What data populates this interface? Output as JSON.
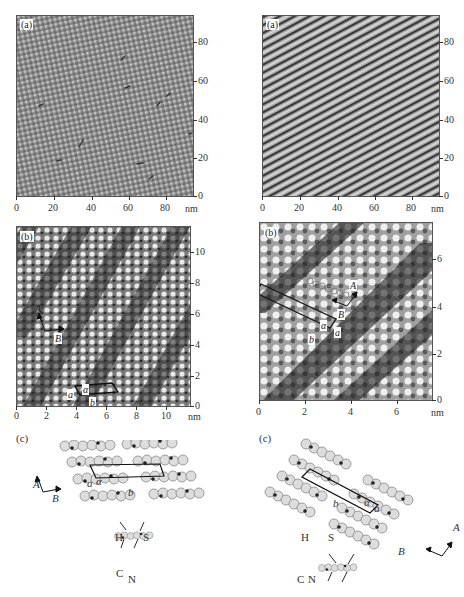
{
  "figure": {
    "panels": [
      {
        "id": "left-a",
        "label": "(a)",
        "x_ticks": [
          "0",
          "20",
          "40",
          "60",
          "80"
        ],
        "y_ticks": [
          "80",
          "60",
          "40",
          "20",
          "0"
        ],
        "unit": "nm",
        "range_nm": 95,
        "texture": "square lattice",
        "colors": {
          "base": "#8c8c8c",
          "light": "#c8c8c8",
          "dark": "#4a4a4a"
        }
      },
      {
        "id": "right-a",
        "label": "(a)",
        "x_ticks": [
          "0",
          "20",
          "40",
          "60",
          "80"
        ],
        "y_ticks": [
          "80",
          "60",
          "40",
          "20",
          "0"
        ],
        "unit": "nm",
        "range_nm": 95,
        "texture": "diagonal stripes",
        "colors": {
          "base": "#9a9a9a",
          "light": "#d8d8d8",
          "dark": "#3a3a3a"
        }
      },
      {
        "id": "left-b",
        "label": "(b)",
        "x_ticks": [
          "0",
          "2",
          "4",
          "6",
          "8",
          "10"
        ],
        "y_ticks": [
          "10",
          "8",
          "6",
          "4",
          "2",
          "0"
        ],
        "unit": "nm",
        "range_nm": 11.5,
        "annotations": {
          "axis_A": "A",
          "axis_B": "B",
          "cell_a": "a",
          "cell_b": "b",
          "angle": "α"
        }
      },
      {
        "id": "right-b",
        "label": "(b)",
        "x_ticks": [
          "0",
          "2",
          "4",
          "6"
        ],
        "y_ticks": [
          "6",
          "4",
          "2",
          "0"
        ],
        "unit": "nm",
        "range_nm": 7.5,
        "annotations": {
          "axis_A": "A",
          "axis_B": "B",
          "cell_a": "a",
          "cell_b": "b",
          "angle": "α"
        }
      }
    ],
    "models": [
      {
        "id": "left-c",
        "label": "(c)",
        "axis_A": "A",
        "axis_B": "B",
        "cell_a": "a",
        "cell_b": "b",
        "angle": "α",
        "atoms": {
          "H": "H",
          "S": "S",
          "C": "C",
          "N": "N"
        }
      },
      {
        "id": "right-c",
        "label": "(c)",
        "axis_A": "A",
        "axis_B": "B",
        "cell_a": "a",
        "cell_b": "b",
        "angle": "α",
        "atoms": {
          "H": "H",
          "S": "S",
          "C": "C",
          "N": "N"
        }
      }
    ]
  }
}
